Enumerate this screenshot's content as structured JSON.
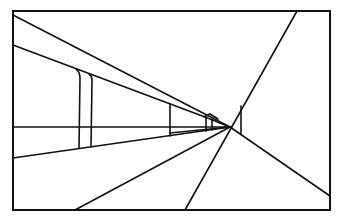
{
  "figure": {
    "type": "one-point perspective line drawing",
    "stroke_color": "#111111",
    "background_color": "#ffffff",
    "frame": {
      "x1": 13,
      "y1": 11,
      "x2": 330,
      "y2": 210
    },
    "vanishing_point": {
      "x": 230,
      "y": 127
    },
    "horizon_y": 127
  }
}
